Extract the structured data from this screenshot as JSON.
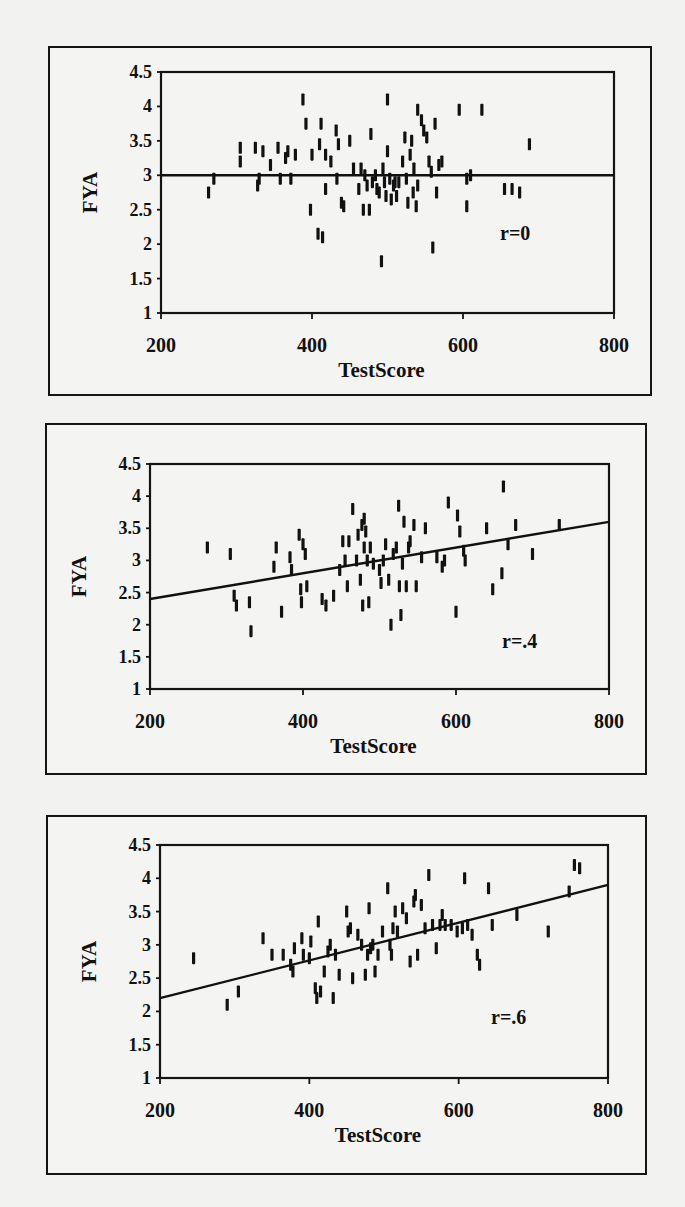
{
  "chart_data": [
    {
      "type": "scatter",
      "title": "",
      "xlabel": "TestScore",
      "ylabel": "FYA",
      "xlim": [
        200,
        800
      ],
      "ylim": [
        1,
        4.5
      ],
      "xticks": [
        200,
        400,
        600,
        800
      ],
      "yticks": [
        1,
        1.5,
        2,
        2.5,
        3,
        3.5,
        4,
        4.5
      ],
      "xtick_labels": [
        "200",
        "400",
        "600",
        "800"
      ],
      "ytick_labels": [
        "1",
        "1.5",
        "2",
        "2.5",
        "3",
        "3.5",
        "4",
        "4.5"
      ],
      "grid": false,
      "marker": "short vertical bar",
      "annotation": "r=0",
      "correlation": 0,
      "regression_line": {
        "x": [
          200,
          800
        ],
        "y": [
          3.0,
          3.0
        ]
      },
      "layout": {
        "frame": [
          48,
          46,
          604,
          350
        ],
        "plot": [
          159,
          70,
          453,
          241
        ],
        "annotation_pos": [
          498,
          238
        ]
      },
      "points": [
        [
          263,
          2.75
        ],
        [
          270,
          2.95
        ],
        [
          305,
          3.2
        ],
        [
          305,
          3.4
        ],
        [
          325,
          3.4
        ],
        [
          328,
          2.85
        ],
        [
          330,
          2.95
        ],
        [
          335,
          3.35
        ],
        [
          345,
          3.15
        ],
        [
          355,
          3.4
        ],
        [
          358,
          2.95
        ],
        [
          365,
          3.25
        ],
        [
          368,
          3.35
        ],
        [
          372,
          2.95
        ],
        [
          378,
          3.3
        ],
        [
          388,
          4.1
        ],
        [
          392,
          3.75
        ],
        [
          398,
          2.5
        ],
        [
          400,
          3.3
        ],
        [
          408,
          2.15
        ],
        [
          410,
          3.45
        ],
        [
          412,
          3.75
        ],
        [
          414,
          2.1
        ],
        [
          418,
          3.3
        ],
        [
          418,
          2.8
        ],
        [
          425,
          3.2
        ],
        [
          432,
          3.65
        ],
        [
          433,
          2.95
        ],
        [
          435,
          3.45
        ],
        [
          439,
          2.6
        ],
        [
          442,
          2.55
        ],
        [
          450,
          3.5
        ],
        [
          455,
          3.1
        ],
        [
          462,
          2.8
        ],
        [
          465,
          3.1
        ],
        [
          468,
          2.5
        ],
        [
          470,
          3.0
        ],
        [
          473,
          2.85
        ],
        [
          476,
          2.5
        ],
        [
          478,
          3.6
        ],
        [
          480,
          2.9
        ],
        [
          484,
          3.0
        ],
        [
          486,
          2.8
        ],
        [
          489,
          2.75
        ],
        [
          492,
          1.75
        ],
        [
          494,
          3.1
        ],
        [
          496,
          2.9
        ],
        [
          498,
          2.7
        ],
        [
          500,
          4.1
        ],
        [
          500,
          3.35
        ],
        [
          503,
          2.95
        ],
        [
          505,
          2.65
        ],
        [
          508,
          2.85
        ],
        [
          510,
          2.9
        ],
        [
          512,
          2.7
        ],
        [
          515,
          2.9
        ],
        [
          520,
          3.2
        ],
        [
          523,
          3.55
        ],
        [
          525,
          2.95
        ],
        [
          527,
          2.6
        ],
        [
          530,
          3.3
        ],
        [
          532,
          3.5
        ],
        [
          534,
          2.75
        ],
        [
          535,
          3.1
        ],
        [
          538,
          2.55
        ],
        [
          540,
          3.95
        ],
        [
          540,
          2.85
        ],
        [
          545,
          3.8
        ],
        [
          548,
          3.65
        ],
        [
          552,
          3.55
        ],
        [
          555,
          3.2
        ],
        [
          558,
          3.05
        ],
        [
          560,
          1.95
        ],
        [
          563,
          3.75
        ],
        [
          565,
          2.75
        ],
        [
          568,
          3.15
        ],
        [
          572,
          3.2
        ],
        [
          595,
          3.95
        ],
        [
          605,
          2.95
        ],
        [
          605,
          2.55
        ],
        [
          610,
          3.0
        ],
        [
          625,
          3.95
        ],
        [
          655,
          2.8
        ],
        [
          665,
          2.8
        ],
        [
          675,
          2.75
        ],
        [
          688,
          3.45
        ]
      ]
    },
    {
      "type": "scatter",
      "title": "",
      "xlabel": "TestScore",
      "ylabel": "FYA",
      "xlim": [
        200,
        800
      ],
      "ylim": [
        1,
        4.5
      ],
      "xticks": [
        200,
        400,
        600,
        800
      ],
      "yticks": [
        1,
        1.5,
        2,
        2.5,
        3,
        3.5,
        4,
        4.5
      ],
      "xtick_labels": [
        "200",
        "400",
        "600",
        "800"
      ],
      "ytick_labels": [
        "1",
        "1.5",
        "2",
        "2.5",
        "3",
        "3.5",
        "4",
        "4.5"
      ],
      "grid": false,
      "marker": "short vertical bar",
      "annotation": "r=.4",
      "correlation": 0.4,
      "regression_line": {
        "x": [
          200,
          800
        ],
        "y": [
          2.4,
          3.6
        ]
      },
      "layout": {
        "frame": [
          45,
          423,
          602,
          352
        ],
        "plot": [
          148,
          462,
          459,
          225
        ],
        "annotation_pos": [
          500,
          646
        ]
      },
      "points": [
        [
          275,
          3.2
        ],
        [
          305,
          3.1
        ],
        [
          310,
          2.45
        ],
        [
          313,
          2.3
        ],
        [
          330,
          2.35
        ],
        [
          332,
          1.9
        ],
        [
          362,
          2.9
        ],
        [
          365,
          3.2
        ],
        [
          372,
          2.2
        ],
        [
          383,
          3.05
        ],
        [
          385,
          2.85
        ],
        [
          395,
          3.4
        ],
        [
          397,
          2.55
        ],
        [
          398,
          2.35
        ],
        [
          400,
          3.25
        ],
        [
          403,
          3.1
        ],
        [
          405,
          2.6
        ],
        [
          425,
          2.4
        ],
        [
          430,
          2.3
        ],
        [
          440,
          2.45
        ],
        [
          448,
          2.85
        ],
        [
          452,
          3.3
        ],
        [
          455,
          3.0
        ],
        [
          458,
          2.6
        ],
        [
          460,
          3.3
        ],
        [
          465,
          3.8
        ],
        [
          470,
          3.0
        ],
        [
          472,
          3.4
        ],
        [
          475,
          2.7
        ],
        [
          477,
          3.55
        ],
        [
          478,
          2.3
        ],
        [
          480,
          3.65
        ],
        [
          480,
          3.2
        ],
        [
          482,
          3.45
        ],
        [
          484,
          3.0
        ],
        [
          486,
          2.35
        ],
        [
          488,
          3.2
        ],
        [
          492,
          2.95
        ],
        [
          500,
          2.85
        ],
        [
          502,
          2.65
        ],
        [
          505,
          3.0
        ],
        [
          508,
          3.25
        ],
        [
          512,
          2.7
        ],
        [
          515,
          2.0
        ],
        [
          518,
          3.1
        ],
        [
          522,
          3.2
        ],
        [
          525,
          3.85
        ],
        [
          526,
          2.6
        ],
        [
          528,
          2.15
        ],
        [
          530,
          2.95
        ],
        [
          532,
          3.6
        ],
        [
          535,
          2.6
        ],
        [
          538,
          3.2
        ],
        [
          540,
          3.3
        ],
        [
          545,
          3.55
        ],
        [
          548,
          2.6
        ],
        [
          555,
          3.05
        ],
        [
          560,
          3.5
        ],
        [
          575,
          3.05
        ],
        [
          582,
          2.9
        ],
        [
          585,
          3.0
        ],
        [
          590,
          3.9
        ],
        [
          600,
          2.2
        ],
        [
          602,
          3.7
        ],
        [
          605,
          3.45
        ],
        [
          610,
          3.15
        ],
        [
          612,
          3.0
        ],
        [
          640,
          3.5
        ],
        [
          648,
          2.55
        ],
        [
          660,
          2.8
        ],
        [
          662,
          4.15
        ],
        [
          668,
          3.25
        ],
        [
          678,
          3.55
        ],
        [
          700,
          3.1
        ],
        [
          735,
          3.55
        ]
      ]
    },
    {
      "type": "scatter",
      "title": "",
      "xlabel": "TestScore",
      "ylabel": "FYA",
      "xlim": [
        200,
        800
      ],
      "ylim": [
        1,
        4.5
      ],
      "xticks": [
        200,
        400,
        600,
        800
      ],
      "yticks": [
        1,
        1.5,
        2,
        2.5,
        3,
        3.5,
        4,
        4.5
      ],
      "xtick_labels": [
        "200",
        "400",
        "600",
        "800"
      ],
      "ytick_labels": [
        "1",
        "1.5",
        "2",
        "2.5",
        "3",
        "3.5",
        "4",
        "4.5"
      ],
      "grid": false,
      "marker": "short vertical bar",
      "annotation": "r=.6",
      "correlation": 0.6,
      "regression_line": {
        "x": [
          200,
          800
        ],
        "y": [
          2.2,
          3.9
        ]
      },
      "layout": {
        "frame": [
          46,
          815,
          601,
          360
        ],
        "plot": [
          158,
          843,
          448,
          233
        ],
        "annotation_pos": [
          489,
          1022
        ]
      },
      "points": [
        [
          245,
          2.8
        ],
        [
          290,
          2.1
        ],
        [
          305,
          2.3
        ],
        [
          338,
          3.1
        ],
        [
          350,
          2.85
        ],
        [
          365,
          2.85
        ],
        [
          375,
          2.7
        ],
        [
          378,
          2.6
        ],
        [
          380,
          2.95
        ],
        [
          390,
          3.1
        ],
        [
          392,
          2.85
        ],
        [
          400,
          2.8
        ],
        [
          402,
          3.05
        ],
        [
          408,
          2.35
        ],
        [
          410,
          2.2
        ],
        [
          412,
          3.35
        ],
        [
          415,
          2.3
        ],
        [
          420,
          2.6
        ],
        [
          425,
          2.9
        ],
        [
          428,
          3.0
        ],
        [
          432,
          2.2
        ],
        [
          435,
          2.85
        ],
        [
          440,
          2.55
        ],
        [
          450,
          3.5
        ],
        [
          452,
          3.2
        ],
        [
          455,
          3.25
        ],
        [
          458,
          2.5
        ],
        [
          465,
          3.15
        ],
        [
          470,
          3.0
        ],
        [
          475,
          2.55
        ],
        [
          478,
          2.85
        ],
        [
          480,
          3.55
        ],
        [
          482,
          2.95
        ],
        [
          485,
          3.0
        ],
        [
          488,
          2.6
        ],
        [
          492,
          2.85
        ],
        [
          498,
          3.2
        ],
        [
          505,
          3.85
        ],
        [
          508,
          3.0
        ],
        [
          510,
          2.85
        ],
        [
          512,
          3.25
        ],
        [
          515,
          3.5
        ],
        [
          518,
          3.2
        ],
        [
          525,
          3.55
        ],
        [
          530,
          3.4
        ],
        [
          535,
          2.75
        ],
        [
          540,
          3.65
        ],
        [
          542,
          3.75
        ],
        [
          545,
          2.85
        ],
        [
          550,
          3.6
        ],
        [
          555,
          3.25
        ],
        [
          560,
          4.05
        ],
        [
          565,
          3.3
        ],
        [
          570,
          2.95
        ],
        [
          575,
          3.3
        ],
        [
          578,
          3.45
        ],
        [
          582,
          3.3
        ],
        [
          590,
          3.3
        ],
        [
          598,
          3.2
        ],
        [
          605,
          3.25
        ],
        [
          608,
          4.0
        ],
        [
          612,
          3.3
        ],
        [
          618,
          3.15
        ],
        [
          625,
          2.85
        ],
        [
          628,
          2.7
        ],
        [
          640,
          3.85
        ],
        [
          645,
          3.3
        ],
        [
          678,
          3.45
        ],
        [
          720,
          3.2
        ],
        [
          748,
          3.8
        ],
        [
          755,
          4.2
        ],
        [
          762,
          4.15
        ]
      ]
    }
  ]
}
